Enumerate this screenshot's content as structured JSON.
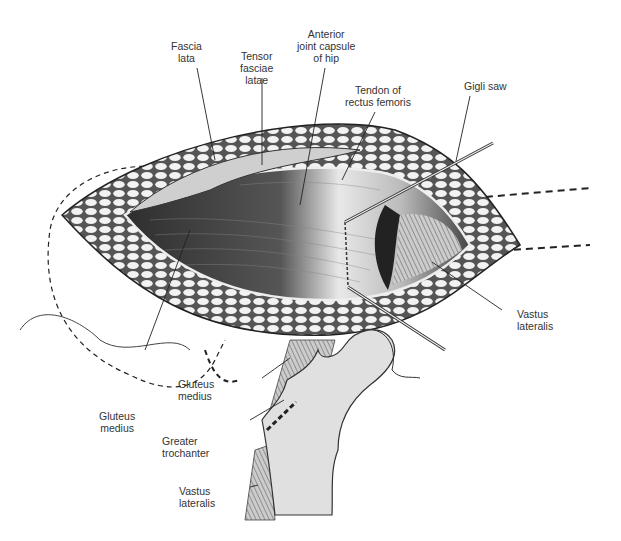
{
  "figure": {
    "colors": {
      "ink": "#222222",
      "bone": "#e2e2e2",
      "muscle_dark": "#3a3a3a",
      "muscle_light": "#d8d8d8",
      "fat": "#f0f0f0"
    }
  },
  "labels": {
    "fascia_lata": "Fascia\nlata",
    "tensor_fasciae_latae": "Tensor\nfasciae\nlatae",
    "anterior_joint_capsule": "Anterior\njoint capsule\nof hip",
    "tendon_rectus_femoris": "Tendon of\nrectus femoris",
    "gigli_saw": "Gigli saw",
    "vastus_lateralis_top": "Vastus\nlateralis",
    "gluteus_medius_left": "Gluteus\nmedius",
    "gluteus_medius_inset": "Gluteus\nmedius",
    "greater_trochanter": "Greater\ntrochanter",
    "vastus_lateralis_inset": "Vastus\nlateralis"
  }
}
